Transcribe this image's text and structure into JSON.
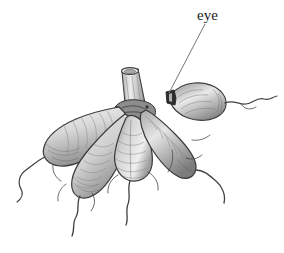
{
  "figure": {
    "medium": "pencil drawing",
    "background_color": "#ffffff",
    "ink_color": "#3a3a3a",
    "shading_color": "#9a9a9a",
    "width": 284,
    "height": 253
  },
  "annotations": {
    "eye_label": {
      "text": "eye",
      "x": 197,
      "y": 7,
      "font_size": 15,
      "color": "#1a1a1a"
    },
    "leader_line": {
      "from_x": 205,
      "from_y": 24,
      "to_x": 169,
      "to_y": 93,
      "color": "#777777",
      "width": 1
    }
  },
  "parts": {
    "stem": {
      "name": "cut stem",
      "description": "hollow cut stalk rising from the center of the tuber cluster"
    },
    "detached_tuber": {
      "name": "detached tuber with eye",
      "description": "single oval tuber at right, separated from cluster, with dark notched eye at its left tip and a thin trailing root"
    },
    "tubers": [
      {
        "name": "upper-left tuber",
        "description": "long elongated tuber angled down-left with banded hatching"
      },
      {
        "name": "lower-left tuber",
        "description": "elongated tuber angled down-left, overlapping the upper-left one"
      },
      {
        "name": "center tuber",
        "description": "pear-shaped tuber hanging straight down beneath the stem"
      },
      {
        "name": "right tuber",
        "description": "elongated tuber angled down-right from the stem base"
      }
    ],
    "roots": {
      "name": "fibrous roots",
      "description": "thin wavy thread-like roots trailing from the tips of each tuber"
    }
  }
}
